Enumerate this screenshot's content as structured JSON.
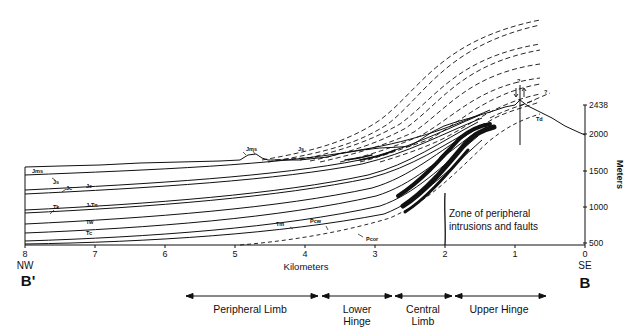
{
  "diagram": {
    "type": "geologic cross-section",
    "section_start": "B'",
    "section_end": "B",
    "direction_left": "NW",
    "direction_right": "SE",
    "x_axis": {
      "title": "Kilometers",
      "ticks": [
        "8",
        "7",
        "6",
        "5",
        "4",
        "3",
        "2",
        "1",
        "0"
      ]
    },
    "y_axis": {
      "title": "Meters",
      "ticks": [
        "2438",
        "2000",
        "1500",
        "1000",
        "500"
      ]
    },
    "formation_labels": [
      "Jms",
      "Js",
      "Jc",
      "Je",
      "J-Tn",
      "Tk",
      "Tw",
      "Tc",
      "Tm",
      "Pcw",
      "Pcor",
      "Jms",
      "Js",
      "Td"
    ],
    "annotation": {
      "line1": "Zone of peripheral",
      "line2": "intrusions and faults"
    },
    "fault_query": "?",
    "fault_query2": "?",
    "regions": [
      {
        "line1": "Peripheral Limb",
        "line2": ""
      },
      {
        "line1": "Lower",
        "line2": "Hinge"
      },
      {
        "line1": "Central",
        "line2": "Limb"
      },
      {
        "line1": "Upper Hinge",
        "line2": ""
      }
    ]
  }
}
